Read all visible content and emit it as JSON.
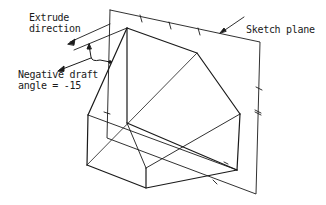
{
  "diagram": {
    "type": "3d-extrusion-with-draft",
    "labels": {
      "extrude_line1": "Extrude",
      "extrude_line2": "direction",
      "draft_line1": "Negative draft",
      "draft_line2": "angle = -15",
      "sketch_plane": "Sketch plane"
    },
    "colors": {
      "line": "#1a1a1a",
      "background": "#ffffff"
    },
    "elements": [
      "sketch-plane",
      "drafted-solid",
      "extrude-direction-arrow",
      "draft-angle-indicator"
    ]
  }
}
